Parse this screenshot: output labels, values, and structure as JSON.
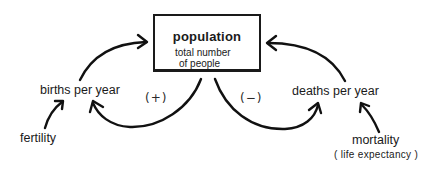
{
  "diagram": {
    "type": "causal-loop",
    "stock": {
      "title": "population",
      "description_line1": "total number",
      "description_line2": "of people"
    },
    "flows": {
      "inflow": "births per year",
      "outflow": "deaths per year"
    },
    "loops": {
      "positive_sign": "(+)",
      "negative_sign": "(−)"
    },
    "parameters": {
      "fertility": "fertility",
      "mortality": "mortality",
      "mortality_note": "( life expectancy )"
    },
    "stroke_color": "#111111"
  }
}
